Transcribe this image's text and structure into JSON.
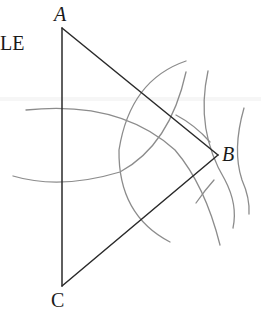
{
  "diagram": {
    "type": "geometric-construction",
    "partial_text": "LE",
    "vertices": [
      {
        "name": "A",
        "label": "A",
        "x": 62,
        "y": 28
      },
      {
        "name": "B",
        "label": "B",
        "x": 218,
        "y": 155
      },
      {
        "name": "C",
        "label": "C",
        "x": 62,
        "y": 286
      }
    ],
    "segments": [
      {
        "from": "A",
        "to": "B"
      },
      {
        "from": "B",
        "to": "C"
      },
      {
        "from": "C",
        "to": "A"
      }
    ],
    "construction_arcs": 5,
    "colors": {
      "line": "#2a2a2a",
      "arc": "#8c8c8c",
      "text": "#1a1a1a",
      "background": "#ffffff"
    }
  }
}
